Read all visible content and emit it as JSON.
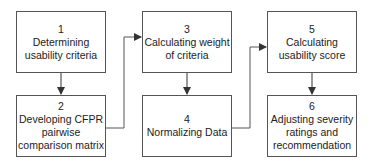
{
  "steps": [
    {
      "number": "1",
      "label_lines": [
        "Determining",
        "usability criteria"
      ]
    },
    {
      "number": "2",
      "label_lines": [
        "Developing CFPR",
        "pairwise",
        "comparison matrix"
      ]
    },
    {
      "number": "3",
      "label_lines": [
        "Calculating weight",
        "of criteria"
      ]
    },
    {
      "number": "4",
      "label_lines": [
        "Normalizing Data"
      ]
    },
    {
      "number": "5",
      "label_lines": [
        "Calculating",
        "usability score"
      ]
    },
    {
      "number": "6",
      "label_lines": [
        "Adjusting severity",
        "ratings and",
        "recommendation"
      ]
    }
  ],
  "colors": {
    "border": "#555555",
    "arrow": "#333333",
    "text": "#222222"
  }
}
